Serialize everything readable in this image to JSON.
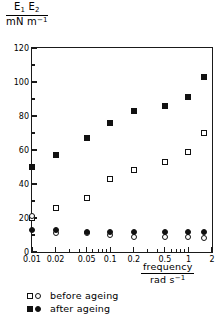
{
  "chart_data": {
    "type": "scatter",
    "title": "",
    "ylabel_numerator": "E1 E2",
    "ylabel_denominator": "mN m-1",
    "xlabel_numerator": "frequency",
    "xlabel_denominator": "rad s-1",
    "xscale": "log",
    "xlim": [
      0.01,
      2.0
    ],
    "ylim": [
      0,
      120
    ],
    "yticks": [
      0,
      20,
      40,
      60,
      80,
      100,
      120
    ],
    "ytick_labels": [
      "0",
      "20",
      "40",
      "60",
      "80",
      "100",
      "120"
    ],
    "yminor_ticks": [
      10,
      30,
      50,
      70,
      90,
      110
    ],
    "xticks": [
      0.01,
      0.02,
      0.05,
      0.1,
      0.2,
      0.5,
      1,
      2
    ],
    "xtick_labels": [
      "0.01",
      "0.02",
      "0.05",
      "0.1",
      "0.2",
      "0.5",
      "1",
      "2"
    ],
    "xminor_ticks": [
      0.03,
      0.04,
      0.06,
      0.07,
      0.08,
      0.09,
      0.3,
      0.4,
      0.6,
      0.7,
      0.8,
      0.9
    ],
    "grid": false,
    "legend_position": "below-left",
    "series": [
      {
        "name": "E1 before ageing",
        "marker": "open-square",
        "legend_group": "before ageing",
        "x": [
          0.01,
          0.02,
          0.05,
          0.1,
          0.2,
          0.5,
          1.0,
          1.6
        ],
        "y": [
          20,
          26,
          32,
          43,
          48,
          53,
          59,
          70
        ]
      },
      {
        "name": "E2 before ageing",
        "marker": "open-circle",
        "legend_group": "before ageing",
        "x": [
          0.01,
          0.02,
          0.05,
          0.1,
          0.2,
          0.5,
          1.0,
          1.6
        ],
        "y": [
          21,
          11,
          11,
          10,
          9,
          9,
          9,
          8
        ]
      },
      {
        "name": "E1 after ageing",
        "marker": "filled-square",
        "legend_group": "after ageing",
        "x": [
          0.01,
          0.02,
          0.05,
          0.1,
          0.2,
          0.5,
          1.0,
          1.6
        ],
        "y": [
          50,
          57,
          67,
          76,
          83,
          86,
          91,
          103
        ]
      },
      {
        "name": "E2 after ageing",
        "marker": "filled-circle",
        "legend_group": "after ageing",
        "x": [
          0.01,
          0.02,
          0.05,
          0.1,
          0.2,
          0.5,
          1.0,
          1.6
        ],
        "y": [
          13,
          13,
          12,
          12,
          12,
          12,
          12,
          12
        ]
      }
    ],
    "legend": [
      {
        "label": "before ageing",
        "markers": [
          "open-square",
          "open-circle"
        ]
      },
      {
        "label": "after ageing",
        "markers": [
          "filled-square",
          "filled-circle"
        ]
      }
    ]
  }
}
